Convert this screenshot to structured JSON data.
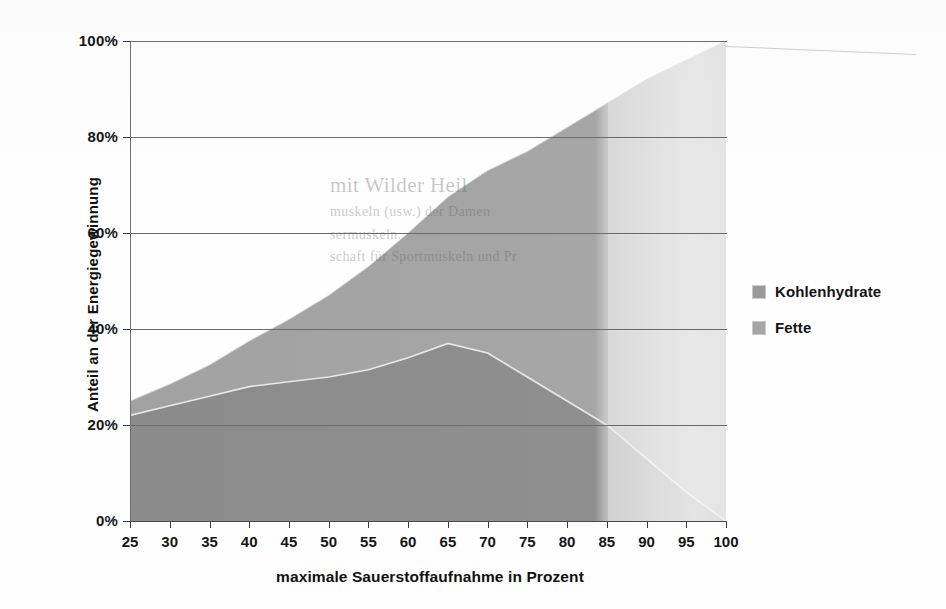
{
  "chart_data": {
    "type": "area",
    "stacked": true,
    "title": "",
    "xlabel": "maximale Sauerstoffaufnahme in Prozent",
    "ylabel": "Anteil an der Energiegewinnung",
    "x": [
      25,
      30,
      35,
      40,
      45,
      50,
      55,
      60,
      65,
      70,
      75,
      80,
      85,
      90,
      95,
      100
    ],
    "xtick_labels": [
      "25",
      "30",
      "35",
      "40",
      "45",
      "50",
      "55",
      "60",
      "65",
      "70",
      "75",
      "80",
      "85",
      "90",
      "95",
      "100"
    ],
    "ytick_labels": [
      "0%",
      "20%",
      "40%",
      "60%",
      "80%",
      "100%"
    ],
    "ytick_values": [
      0,
      20,
      40,
      60,
      80,
      100
    ],
    "xlim": [
      25,
      100
    ],
    "ylim": [
      0,
      100
    ],
    "grid": "horizontal",
    "legend_position": "right",
    "series": [
      {
        "name": "Kohlenhydrate",
        "color": "#8d8d8d",
        "values": [
          22,
          24,
          26,
          28,
          29,
          30,
          31.5,
          34,
          37,
          35,
          30,
          25,
          20,
          13,
          6,
          0
        ]
      },
      {
        "name": "Fette",
        "color": "#a8a8a8",
        "values": [
          3,
          4.5,
          6.5,
          9.5,
          13,
          17,
          21.5,
          26,
          30.5,
          38,
          47,
          57,
          67,
          79,
          90,
          100
        ]
      }
    ],
    "totals": [
      25,
      28.5,
      32.5,
      37.5,
      42,
      47,
      53,
      60,
      67.5,
      73,
      77,
      82,
      87,
      92,
      96,
      100
    ]
  },
  "axes": {
    "y_title": "Anteil an der Energiegewinnung",
    "x_title": "maximale Sauerstoffaufnahme in Prozent"
  },
  "legend": {
    "items": [
      {
        "label": "Kohlenhydrate",
        "color": "#9a9a9a"
      },
      {
        "label": "Fette",
        "color": "#a6a6a6"
      }
    ]
  },
  "watermark": {
    "line1": "mit Wilder Heil",
    "line2": "muskeln (usw.) der Damen",
    "line3": "sermuskeln.",
    "line4": "schaft für Sportmuskeln und Pr"
  }
}
